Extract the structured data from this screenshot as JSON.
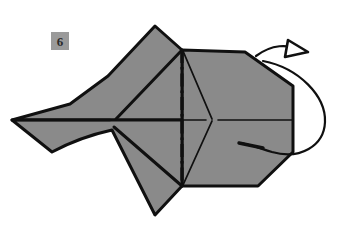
{
  "figure": {
    "step_badge": {
      "number": "6",
      "background_color": "#9a9a9a",
      "text_color": "#2b2b2b"
    },
    "canvas": {
      "width": 348,
      "height": 234,
      "background_color": "#ffffff"
    },
    "colors": {
      "paper_fill": "#8a8a8a",
      "outline": "#101010",
      "fold_line": "#101010",
      "arrow": "#101010"
    },
    "shapes": {
      "upper_left_flap": {
        "name": "upper-left-flap",
        "points": "12,120 118,120 155,26 182,50 182,120"
      },
      "lower_left_flap": {
        "name": "lower-left-flap",
        "points": "12,120 182,120 182,186 155,215 118,128 60,148"
      },
      "right_panel": {
        "name": "right-panel",
        "points": "182,50 245,52 293,86 293,152 258,186 182,186"
      }
    },
    "fold_lines": {
      "vertical_mountain": {
        "name": "vertical-dash-dot-fold",
        "style": "dash-dot",
        "from": "182,50",
        "to": "182,186"
      },
      "horizontal_center": {
        "name": "horizontal-center-fold",
        "style": "thin-solid",
        "from": "12,120",
        "to": "293,120"
      },
      "diagonal_upper": {
        "name": "diagonal-upper-fold",
        "from": "182,50",
        "to": "212,120"
      },
      "diagonal_lower": {
        "name": "diagonal-lower-fold",
        "from": "182,186",
        "to": "212,120"
      },
      "left_crease_upper": {
        "name": "left-crease-upper",
        "from": "118,120",
        "to": "182,50"
      },
      "left_crease_lower": {
        "name": "left-crease-lower",
        "from": "118,128",
        "to": "182,186"
      }
    },
    "arrow": {
      "name": "turn-over-arrow",
      "type": "rotate-flip",
      "direction": "clockwise-around-vertical-right-edge",
      "head_style": "hollow-triangle",
      "head_position": "305,50"
    }
  }
}
